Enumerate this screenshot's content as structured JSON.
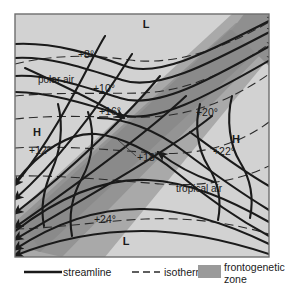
{
  "figure": {
    "type": "meteorological-streamline-isotherm-diagram",
    "frame": {
      "x": 14,
      "y": 13,
      "width": 256,
      "height": 245
    },
    "background_color": "#d0d0d0",
    "frontogenetic_zone_color": "#a8a8a8",
    "frontogenetic_zone_core_color": "#8c8c8c",
    "line_color": "#1a1a1a"
  },
  "pressure_centers": [
    {
      "name": "low-top",
      "label": "L",
      "x": 146,
      "y": 28
    },
    {
      "name": "high-left",
      "label": "H",
      "x": 37,
      "y": 136
    },
    {
      "name": "high-right",
      "label": "H",
      "x": 236,
      "y": 143
    },
    {
      "name": "low-bottom",
      "label": "L",
      "x": 126,
      "y": 245
    }
  ],
  "air_masses": [
    {
      "name": "polar-air",
      "label": "polar air",
      "x": 38,
      "y": 83
    },
    {
      "name": "tropical-air",
      "label": "tropical air",
      "x": 176,
      "y": 192
    }
  ],
  "isotherm_labels": [
    {
      "name": "isotherm-8",
      "label": "+8°",
      "x": 86,
      "y": 58
    },
    {
      "name": "isotherm-10",
      "label": "+10°",
      "x": 104,
      "y": 92
    },
    {
      "name": "isotherm-16",
      "label": "+16°",
      "x": 110,
      "y": 115
    },
    {
      "name": "isotherm-12",
      "label": "+12°",
      "x": 29,
      "y": 154
    },
    {
      "name": "isotherm-18",
      "label": "+18",
      "x": 137,
      "y": 161
    },
    {
      "name": "isotherm-20",
      "label": "+20°",
      "x": 207,
      "y": 116
    },
    {
      "name": "isotherm-22",
      "label": "+22°",
      "x": 224,
      "y": 155
    },
    {
      "name": "isotherm-24",
      "label": "+24°",
      "x": 105,
      "y": 223
    }
  ],
  "legend": {
    "items": [
      {
        "name": "streamline",
        "label": "streamline",
        "style": "solid-line"
      },
      {
        "name": "isotherm",
        "label": "isotherm",
        "style": "dashed-line"
      },
      {
        "name": "frontogenetic-zone",
        "label_line1": "frontogenetic",
        "label_line2": "zone",
        "style": "gray-swatch"
      }
    ]
  }
}
